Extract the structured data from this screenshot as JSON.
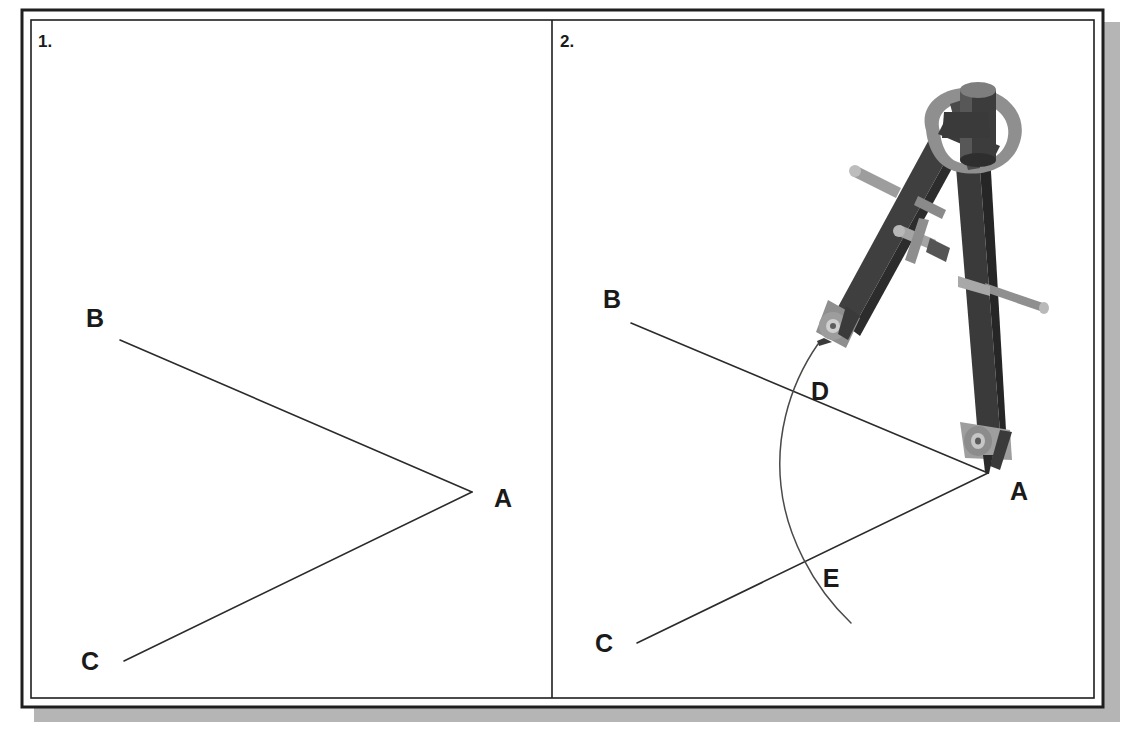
{
  "figure": {
    "background_color": "#ffffff",
    "frame": {
      "border_color": "#1f1f1f",
      "shadow_color": "#b5b5b5",
      "paper_color": "#ffffff"
    }
  },
  "panels": [
    {
      "id": "panel-1",
      "number_label": "1.",
      "caption": "",
      "points": [
        {
          "name": "A",
          "label": "A",
          "x": 472,
          "y": 492,
          "label_x": 497,
          "label_y": 506
        },
        {
          "name": "B",
          "label": "B",
          "x": 120,
          "y": 340,
          "label_x": 95,
          "label_y": 327
        },
        {
          "name": "C",
          "label": "C",
          "x": 124,
          "y": 661,
          "label_x": 82,
          "label_y": 668
        }
      ],
      "rays": [
        {
          "name": "ray-AB",
          "from": "A",
          "to": "B"
        },
        {
          "name": "ray-AC",
          "from": "A",
          "to": "C"
        }
      ],
      "arcs": [],
      "has_compass": false
    },
    {
      "id": "panel-2",
      "number_label": "2.",
      "caption": "",
      "points": [
        {
          "name": "A",
          "label": "A",
          "x": 988,
          "y": 473,
          "label_x": 1012,
          "label_y": 498
        },
        {
          "name": "B",
          "label": "B",
          "x": 631,
          "y": 323,
          "label_x": 610,
          "label_y": 308
        },
        {
          "name": "C",
          "label": "C",
          "x": 637,
          "y": 643,
          "label_x": 596,
          "label_y": 650
        },
        {
          "name": "D",
          "label": "D",
          "x": 800,
          "y": 396,
          "label_x": 812,
          "label_y": 399
        },
        {
          "name": "E",
          "label": "E",
          "x": 806,
          "y": 569,
          "label_x": 820,
          "label_y": 585
        }
      ],
      "rays": [
        {
          "name": "ray-AB",
          "from": "A",
          "to": "B"
        },
        {
          "name": "ray-AC",
          "from": "A",
          "to": "C"
        }
      ],
      "arcs": [
        {
          "name": "compass-arc-DE",
          "center": "A",
          "start_x": 818,
          "start_y": 344,
          "end_x": 851,
          "end_y": 623,
          "bulge_x": 782,
          "bulge_y": 483
        }
      ],
      "has_compass": true,
      "compass": {
        "name": "drawing-compass",
        "hinge_x": 968,
        "hinge_y": 103,
        "pencil_tip_x": 818,
        "pencil_tip_y": 344,
        "needle_tip_x": 988,
        "needle_tip_y": 473,
        "body_color": "#3c3c3c",
        "metal_color": "#9a9a9a",
        "highlight_color": "#c9c9c9",
        "shadow_color": "#2a2a2a"
      }
    }
  ],
  "colors": {
    "ink": "#2b2b2b",
    "label_ink": "#1a1a1a",
    "arc_ink": "#4a4a4a",
    "paper": "#ffffff",
    "frame": "#1f1f1f",
    "shadow": "#b5b5b5"
  }
}
